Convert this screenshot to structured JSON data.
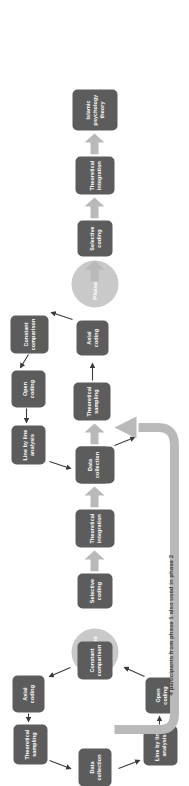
{
  "figure": {
    "colors": {
      "node_fill": "#5c5c5c",
      "node_text": "#ffffff",
      "phase_circle_fill": "#c9c9c9",
      "thick_arrow": "#b9b9b9",
      "thin_arrow": "#3a3a3a",
      "loop_arrow": "#b9b9b9",
      "background": "#ffffff"
    }
  },
  "chain": {
    "label": "linear-theory-building-chain",
    "nodes": [
      {
        "id": "selective-coding-1",
        "text": "Selective coding"
      },
      {
        "id": "theoretical-integration-1",
        "text": "Theoretical integration"
      },
      {
        "id": "model-of-the-soul",
        "text": "Model of the Soul"
      },
      {
        "id": "selective-coding-2",
        "text": "Selective coding"
      },
      {
        "id": "theoretical-integration-2",
        "text": "Theoretical integration"
      },
      {
        "id": "islamic-psychology-theory",
        "text": "Islamic psychology theory"
      }
    ]
  },
  "phase_one": {
    "center_label": "Phase One",
    "nodes": [
      {
        "id": "p1-data-collection",
        "text": "Data collection"
      },
      {
        "id": "p1-line-by-line-analysis",
        "text": "Line by line analysis"
      },
      {
        "id": "p1-open-coding",
        "text": "Open coding"
      },
      {
        "id": "p1-constant-comparison",
        "text": "Constant comparison"
      },
      {
        "id": "p1-axial-coding",
        "text": "Axial coding"
      },
      {
        "id": "p1-theoretical-sampling",
        "text": "Theoretical sampling"
      }
    ]
  },
  "phase_two": {
    "center_label": "Phase Two",
    "nodes": [
      {
        "id": "p2-data-collection",
        "text": "Data collection"
      },
      {
        "id": "p2-line-by-line-analysis",
        "text": "Line by line analysis"
      },
      {
        "id": "p2-open-coding",
        "text": "Open coding"
      },
      {
        "id": "p2-constant-comparison",
        "text": "Constant comparison"
      },
      {
        "id": "p2-axial-coding",
        "text": "Axial coding"
      },
      {
        "id": "p2-theoretical-sampling",
        "text": "Theoretical sampling"
      }
    ]
  },
  "loop": {
    "caption": "4 participants from phase 1 also used in phase 2"
  }
}
